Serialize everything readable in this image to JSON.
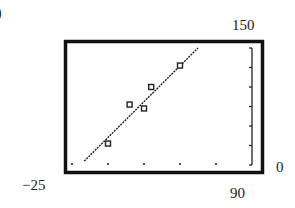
{
  "figure": {
    "part_label": ")",
    "window_labels": {
      "ymax": "150",
      "xmin": "−25",
      "xmax": "0",
      "ymin": "90"
    }
  },
  "colors": {
    "frame": "#111111",
    "ink": "#222222",
    "background": "#ffffff"
  },
  "chart_data": {
    "type": "scatter",
    "title": "",
    "xlabel": "",
    "ylabel": "",
    "xlim": [
      -25,
      0
    ],
    "ylim": [
      90,
      150
    ],
    "xscale_ticks": 5,
    "yscale_ticks": 10,
    "grid": false,
    "series": [
      {
        "name": "data",
        "marker": "square",
        "points": [
          {
            "x": -20,
            "y": 101
          },
          {
            "x": -17,
            "y": 121
          },
          {
            "x": -15,
            "y": 119
          },
          {
            "x": -14,
            "y": 130
          },
          {
            "x": -10,
            "y": 141
          }
        ]
      },
      {
        "name": "regression line",
        "style": "dotted",
        "points": [
          {
            "x": -23.3,
            "y": 92
          },
          {
            "x": -7.5,
            "y": 150
          }
        ]
      }
    ]
  }
}
